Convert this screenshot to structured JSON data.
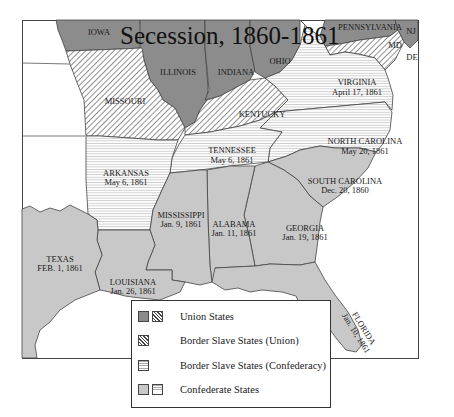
{
  "title": "Secession, 1860-1861",
  "colors": {
    "union": "#8c8c8c",
    "confederate": "#c8c8c8",
    "border_union_hatch": "#444444",
    "border_confederacy_hatch": "#aaaaaa",
    "background": "#ffffff",
    "outline": "#333333"
  },
  "states": {
    "iowa": {
      "name": "IOWA",
      "category": "Union States"
    },
    "illinois": {
      "name": "ILLINOIS",
      "category": "Union States"
    },
    "indiana": {
      "name": "INDIANA",
      "category": "Union States"
    },
    "ohio": {
      "name": "OHIO",
      "category": "Union States"
    },
    "pennsylvania": {
      "name": "PENNSYLVANIA",
      "category": "Union States"
    },
    "new_jersey": {
      "name": "NJ",
      "category": "Union States"
    },
    "missouri": {
      "name": "MISSOURI",
      "category": "Border Slave States (Union)"
    },
    "kentucky": {
      "name": "KENTUCKY",
      "category": "Border Slave States (Union)"
    },
    "maryland": {
      "name": "MD",
      "category": "Border Slave States (Union)"
    },
    "delaware": {
      "name": "DE",
      "category": "Border Slave States (Union)"
    },
    "virginia": {
      "name": "VIRGINIA",
      "date": "April 17, 1861",
      "category": "Border Slave States (Confederacy)"
    },
    "north_carolina": {
      "name": "NORTH CAROLINA",
      "date": "May 20, 1861",
      "category": "Border Slave States (Confederacy)"
    },
    "tennessee": {
      "name": "TENNESSEE",
      "date": "May 6, 1861",
      "category": "Border Slave States (Confederacy)"
    },
    "arkansas": {
      "name": "ARKANSAS",
      "date": "May 6, 1861",
      "category": "Border Slave States (Confederacy)"
    },
    "south_carolina": {
      "name": "SOUTH CAROLINA",
      "date": "Dec. 20, 1860",
      "category": "Confederate States"
    },
    "mississippi": {
      "name": "MISSISSIPPI",
      "date": "Jan. 9, 1861",
      "category": "Confederate States"
    },
    "alabama": {
      "name": "ALABAMA",
      "date": "Jan. 11, 1861",
      "category": "Confederate States"
    },
    "georgia": {
      "name": "GEORGIA",
      "date": "Jan. 19, 1861",
      "category": "Confederate States"
    },
    "florida": {
      "name": "FLORIDA",
      "date": "Jan. 10, 1861",
      "category": "Confederate States"
    },
    "louisiana": {
      "name": "LOUISIANA",
      "date": "Jan. 26, 1861",
      "category": "Confederate States"
    },
    "texas": {
      "name": "TEXAS",
      "date": "FEB. 1, 1861",
      "category": "Confederate States"
    }
  },
  "legend": {
    "items": [
      {
        "label": "Union States",
        "swatches": [
          "solid-dark",
          "diagonal-hatch"
        ]
      },
      {
        "label": "Border Slave States (Union)",
        "swatches": [
          "diagonal-hatch"
        ]
      },
      {
        "label": "Border Slave States (Confederacy)",
        "swatches": [
          "horizontal-hatch"
        ]
      },
      {
        "label": "Confederate States",
        "swatches": [
          "solid-light",
          "horizontal-hatch"
        ]
      }
    ]
  }
}
